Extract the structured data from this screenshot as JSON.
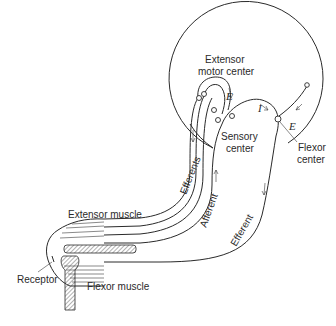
{
  "diagram": {
    "type": "anatomical reflex arc schematic",
    "labels": {
      "extensor_motor_center_line1": "Extensor",
      "extensor_motor_center_line2": "motor center",
      "sensory_center_line1": "Sensory",
      "sensory_center_line2": "center",
      "flexor_center_line1": "Flexor",
      "flexor_center_line2": "center",
      "efferents": "Efferents",
      "afferent": "Afferent",
      "efferent": "Efferent",
      "extensor_muscle": "Extensor muscle",
      "flexor_muscle": "Flexor muscle",
      "receptor": "Receptor",
      "excitatory_1": "E",
      "excitatory_2": "E",
      "inhibitory": "I"
    },
    "colors": {
      "ink": "#2a2a2a",
      "background": "#ffffff"
    }
  }
}
